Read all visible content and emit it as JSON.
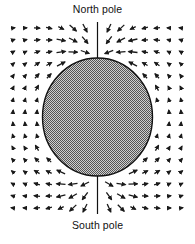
{
  "diagram": {
    "title_top": "North pole",
    "title_bottom": "South pole",
    "sphere": {
      "cx": 97.5,
      "cy": 117,
      "rx": 55,
      "ry": 59,
      "fill": "#9a9a9a",
      "stroke": "#111111"
    },
    "axis_line": {
      "x": 97.5,
      "top_y1": 22,
      "top_y2": 58,
      "bottom_y1": 176,
      "bottom_y2": 214
    },
    "field_grid": {
      "x_start": 13,
      "x_step": 12,
      "cols": 15,
      "y_start": 28,
      "y_step": 12,
      "rows": 16,
      "arrow_color": "#1a1a1a"
    }
  }
}
